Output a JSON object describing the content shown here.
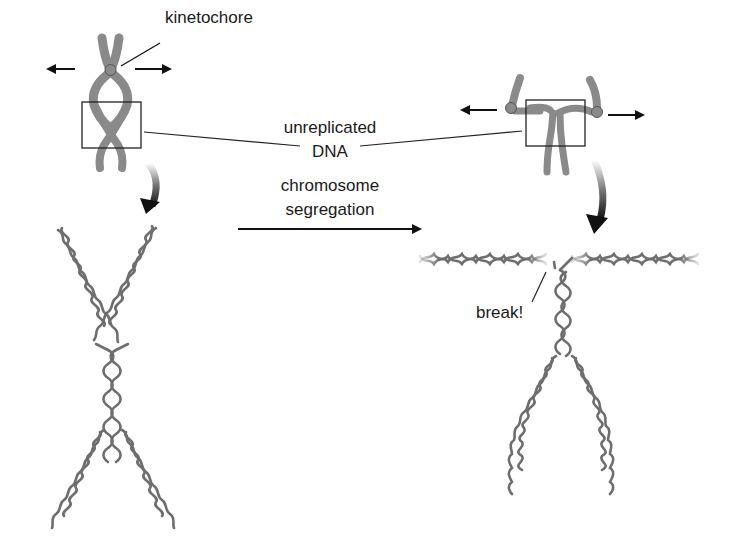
{
  "labels": {
    "kinetochore": "kinetochore",
    "unreplicated_line1": "unreplicated",
    "unreplicated_line2": "DNA",
    "segregation_line1": "chromosome",
    "segregation_line2": "segregation",
    "break": "break!"
  },
  "colors": {
    "chromosome": "#8a8a8a",
    "dna_helix": "#6e6e6e",
    "arrow": "#111111",
    "text": "#1a1a1a",
    "background": "#ffffff"
  },
  "panels": {
    "left_top": "replicated chromosome with kinetochore pulled in opposite directions",
    "right_top": "chromosome under tension with unreplicated region boxed",
    "left_bottom": "zoomed DNA double helix X-structure at unreplicated junction",
    "right_bottom": "DNA helix with break after segregation"
  }
}
